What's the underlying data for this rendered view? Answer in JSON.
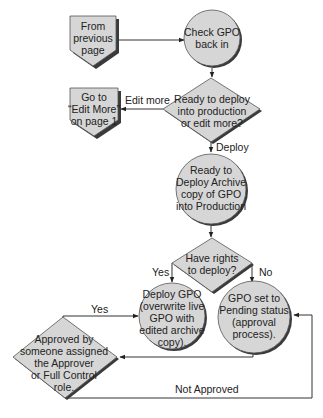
{
  "diagram": {
    "type": "flowchart",
    "colors": {
      "shape_fill": "#d6d6d6",
      "shape_stroke": "#555555",
      "shadow": "#3a3a3a",
      "connector": "#333333",
      "text": "#222222"
    },
    "nodes": {
      "from_previous": {
        "kind": "offpage-connector",
        "lines": [
          "From",
          "previous",
          "page"
        ]
      },
      "edit_more_page": {
        "kind": "offpage-connector",
        "lines": [
          "Go to",
          "“Edit More”",
          "on page 1"
        ]
      },
      "check_in": {
        "kind": "process-circle",
        "lines": [
          "Check GPO",
          "back in"
        ]
      },
      "ready_decision": {
        "kind": "decision",
        "lines": [
          "Ready to deploy",
          "into production",
          "or edit more?"
        ]
      },
      "ready_archive": {
        "kind": "process-circle",
        "lines": [
          "Ready to",
          "Deploy Archive",
          "copy of GPO",
          "into Production"
        ]
      },
      "rights_decision": {
        "kind": "decision",
        "lines": [
          "Have rights",
          "to deploy?"
        ]
      },
      "deploy_gpo": {
        "kind": "process-circle",
        "lines": [
          "Deploy GPO",
          "(overwrite live",
          "GPO with",
          "edited archive",
          "copy)."
        ]
      },
      "pending": {
        "kind": "process-circle",
        "lines": [
          "GPO set to",
          "Pending status",
          "(approval",
          "process)."
        ]
      },
      "approved_decision": {
        "kind": "decision",
        "lines": [
          "Approved by",
          "someone assigned",
          "the Approver",
          "or Full Control",
          "role."
        ]
      }
    },
    "edge_labels": {
      "edit_more": "Edit more",
      "deploy": "Deploy",
      "rights_yes": "Yes",
      "rights_no": "No",
      "approved_yes": "Yes",
      "not_approved": "Not Approved"
    }
  }
}
